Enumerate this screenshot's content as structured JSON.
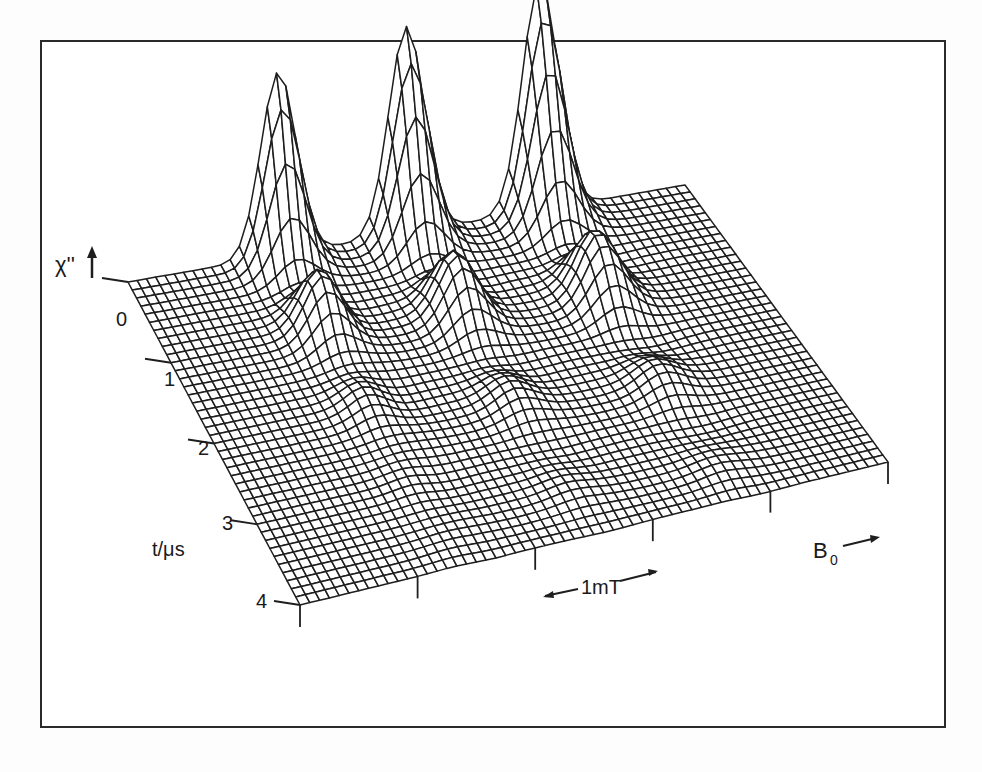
{
  "chart_data": {
    "type": "surface-wireframe",
    "title": "",
    "zlabel": "χ''",
    "ylabel": "t/μs",
    "xlabel": "B₀",
    "y_ticks": [
      "0",
      "1",
      "2",
      "3",
      "4"
    ],
    "y_range": [
      0,
      4
    ],
    "scale_bar": {
      "label": "1mT",
      "description": "field interval indicated by double arrow"
    },
    "grid": {
      "b_lines": 60,
      "t_lines": 40
    },
    "series_description": "Three resonance peaks at t≈0 that decay and oscillate with time (nutation), each peak splitting into damped ripples along t",
    "peaks": [
      {
        "b_position": 0.27,
        "relative_height": 0.8
      },
      {
        "b_position": 0.5,
        "relative_height": 0.9
      },
      {
        "b_position": 0.74,
        "relative_height": 1.0
      }
    ],
    "oscillation_period_us": 1.0,
    "decay_constant_us": 0.9
  },
  "labels": {
    "z_axis": "χ''",
    "t_axis": "t/μs",
    "b_axis": "B",
    "b_axis_sub": "0",
    "scale_bar": "1mT",
    "ticks": [
      "0",
      "1",
      "2",
      "3",
      "4"
    ]
  },
  "geometry": {
    "back_left": [
      128,
      282
    ],
    "back_right": [
      685,
      185
    ],
    "front_left": [
      300,
      605
    ],
    "front_right": [
      888,
      462
    ],
    "height_scale": 230
  },
  "colors": {
    "line": "#1e1e1e",
    "frame": "#2a2a2a",
    "background": "#ffffff"
  }
}
